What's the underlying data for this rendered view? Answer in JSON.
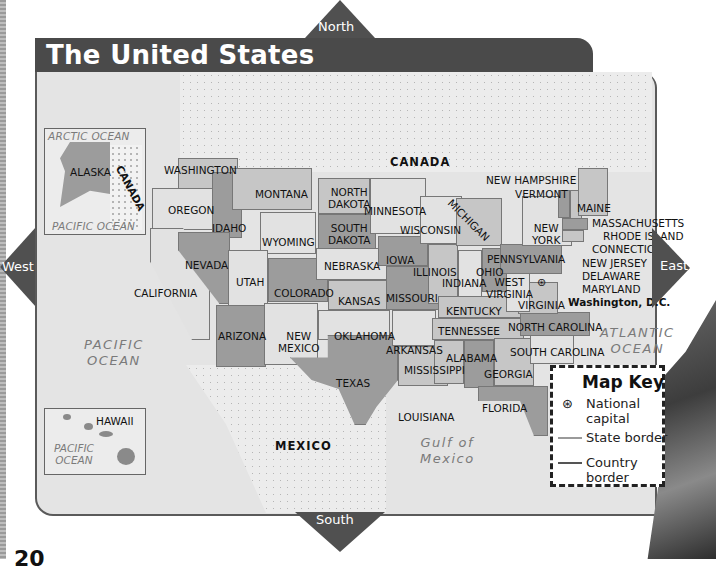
{
  "page": {
    "title": "The United States",
    "page_number": "20"
  },
  "compass": {
    "north": "North",
    "south": "South",
    "east": "East",
    "west": "West"
  },
  "bodies_of_water": {
    "pacific_ocean": [
      "PACIFIC",
      "OCEAN"
    ],
    "atlantic_ocean": [
      "ATLANTIC",
      "OCEAN"
    ],
    "gulf_of_mexico": [
      "Gulf of",
      "Mexico"
    ]
  },
  "countries": {
    "canada": "CANADA",
    "mexico": "MEXICO"
  },
  "insets": {
    "alaska": {
      "arctic": "ARCTIC OCEAN",
      "state": "ALASKA",
      "neighbor": "CANADA",
      "pacific": "PACIFIC OCEAN"
    },
    "hawaii": {
      "state": "HAWAII",
      "ocean": [
        "PACIFIC",
        "OCEAN"
      ]
    }
  },
  "states": {
    "washington": "WASHINGTON",
    "oregon": "OREGON",
    "california": "CALIFORNIA",
    "idaho": "IDAHO",
    "nevada": "NEVADA",
    "montana": "MONTANA",
    "wyoming": "WYOMING",
    "utah": "UTAH",
    "arizona": "ARIZONA",
    "colorado": "COLORADO",
    "new_mexico": [
      "NEW",
      "MEXICO"
    ],
    "north_dakota": [
      "NORTH",
      "DAKOTA"
    ],
    "south_dakota": [
      "SOUTH",
      "DAKOTA"
    ],
    "nebraska": "NEBRASKA",
    "kansas": "KANSAS",
    "oklahoma": "OKLAHOMA",
    "texas": "TEXAS",
    "minnesota": "MINNESOTA",
    "iowa": "IOWA",
    "missouri": "MISSOURI",
    "arkansas": "ARKANSAS",
    "louisiana": "LOUISIANA",
    "wisconsin": "WISCONSIN",
    "illinois": "ILLINOIS",
    "michigan": "MICHIGAN",
    "indiana": "INDIANA",
    "ohio": "OHIO",
    "kentucky": "KENTUCKY",
    "tennessee": "TENNESSEE",
    "mississippi": "MISSISSIPPI",
    "alabama": "ALABAMA",
    "georgia": "GEORGIA",
    "florida": "FLORIDA",
    "south_carolina": "SOUTH CAROLINA",
    "north_carolina": "NORTH CAROLINA",
    "virginia": "VIRGINIA",
    "west_virginia": [
      "WEST",
      "VIRGINIA"
    ],
    "pennsylvania": "PENNSYLVANIA",
    "new_york": [
      "NEW",
      "YORK"
    ],
    "vermont": "VERMONT",
    "new_hampshire": "NEW HAMPSHIRE",
    "maine": "MAINE",
    "massachusetts": "MASSACHUSETTS",
    "rhode_island": "RHODE ISLAND",
    "connecticut": "CONNECTICUT",
    "new_jersey": "NEW JERSEY",
    "delaware": "DELAWARE",
    "maryland": "MARYLAND"
  },
  "capital": {
    "label": "Washington, D.C.",
    "icon": "star-in-circle-icon"
  },
  "map_key": {
    "title": "Map Key",
    "items": [
      {
        "icon": "star-in-circle-icon",
        "label": [
          "National",
          "capital"
        ]
      },
      {
        "icon": "state-border-line",
        "label": [
          "State border"
        ],
        "color": "#9a9a9a"
      },
      {
        "icon": "country-border-line",
        "label": [
          "Country",
          "border"
        ],
        "color": "#555555"
      }
    ]
  },
  "colors": {
    "title_bar": "#4a4a4a",
    "compass": "#505050",
    "water": "#e4e4e4"
  }
}
